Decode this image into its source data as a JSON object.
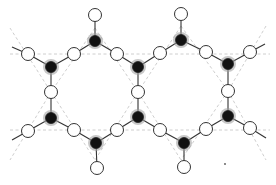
{
  "diagram": {
    "colors": {
      "bond": "#333333",
      "guide": "#c8c8c8",
      "white_node_fill": "#ffffff",
      "black_node_fill": "#111111",
      "halo": "#9a9a9a"
    },
    "node_radius": {
      "white": 6.5,
      "black": 5.5,
      "halo": 8
    },
    "black_nodes": [
      [
        95,
        41
      ],
      [
        181,
        40
      ],
      [
        51,
        67
      ],
      [
        138,
        67
      ],
      [
        228,
        64
      ],
      [
        51,
        118
      ],
      [
        138,
        117
      ],
      [
        228,
        116
      ],
      [
        96,
        143
      ],
      [
        184,
        143
      ]
    ],
    "white_nodes": [
      [
        95,
        15
      ],
      [
        181,
        14
      ],
      [
        28,
        54
      ],
      [
        74,
        54
      ],
      [
        117,
        54
      ],
      [
        160,
        53
      ],
      [
        206,
        52
      ],
      [
        250,
        52
      ],
      [
        51,
        92
      ],
      [
        138,
        92
      ],
      [
        228,
        91
      ],
      [
        28,
        131
      ],
      [
        74,
        130
      ],
      [
        117,
        130
      ],
      [
        160,
        130
      ],
      [
        206,
        129
      ],
      [
        250,
        128
      ],
      [
        97,
        168
      ],
      [
        184,
        167
      ]
    ],
    "bonds": [
      [
        [
          95,
          15
        ],
        [
          95,
          41
        ]
      ],
      [
        [
          181,
          14
        ],
        [
          181,
          40
        ]
      ],
      [
        [
          95,
          41
        ],
        [
          74,
          54
        ]
      ],
      [
        [
          95,
          41
        ],
        [
          117,
          54
        ]
      ],
      [
        [
          181,
          40
        ],
        [
          160,
          53
        ]
      ],
      [
        [
          181,
          40
        ],
        [
          206,
          52
        ]
      ],
      [
        [
          12,
          47
        ],
        [
          28,
          54
        ]
      ],
      [
        [
          28,
          54
        ],
        [
          51,
          67
        ]
      ],
      [
        [
          74,
          54
        ],
        [
          51,
          67
        ]
      ],
      [
        [
          117,
          54
        ],
        [
          138,
          67
        ]
      ],
      [
        [
          160,
          53
        ],
        [
          138,
          67
        ]
      ],
      [
        [
          206,
          52
        ],
        [
          228,
          64
        ]
      ],
      [
        [
          250,
          52
        ],
        [
          228,
          64
        ]
      ],
      [
        [
          250,
          52
        ],
        [
          265,
          44
        ]
      ],
      [
        [
          51,
          67
        ],
        [
          51,
          92
        ]
      ],
      [
        [
          51,
          92
        ],
        [
          51,
          118
        ]
      ],
      [
        [
          138,
          67
        ],
        [
          138,
          92
        ]
      ],
      [
        [
          138,
          92
        ],
        [
          138,
          117
        ]
      ],
      [
        [
          228,
          64
        ],
        [
          228,
          91
        ]
      ],
      [
        [
          228,
          91
        ],
        [
          228,
          116
        ]
      ],
      [
        [
          12,
          140
        ],
        [
          28,
          131
        ]
      ],
      [
        [
          28,
          131
        ],
        [
          51,
          118
        ]
      ],
      [
        [
          74,
          130
        ],
        [
          51,
          118
        ]
      ],
      [
        [
          74,
          130
        ],
        [
          96,
          143
        ]
      ],
      [
        [
          117,
          130
        ],
        [
          96,
          143
        ]
      ],
      [
        [
          117,
          130
        ],
        [
          138,
          117
        ]
      ],
      [
        [
          160,
          130
        ],
        [
          138,
          117
        ]
      ],
      [
        [
          160,
          130
        ],
        [
          184,
          143
        ]
      ],
      [
        [
          206,
          129
        ],
        [
          184,
          143
        ]
      ],
      [
        [
          206,
          129
        ],
        [
          228,
          116
        ]
      ],
      [
        [
          250,
          128
        ],
        [
          228,
          116
        ]
      ],
      [
        [
          250,
          128
        ],
        [
          266,
          138
        ]
      ],
      [
        [
          96,
          143
        ],
        [
          97,
          168
        ]
      ],
      [
        [
          184,
          143
        ],
        [
          184,
          167
        ]
      ]
    ],
    "guides": [
      [
        [
          10,
          54
        ],
        [
          270,
          54
        ]
      ],
      [
        [
          10,
          130
        ],
        [
          270,
          130
        ]
      ],
      [
        [
          10,
          28
        ],
        [
          51,
          92
        ]
      ],
      [
        [
          51,
          92
        ],
        [
          10,
          160
        ]
      ],
      [
        [
          95,
          28
        ],
        [
          138,
          92
        ]
      ],
      [
        [
          138,
          92
        ],
        [
          95,
          160
        ]
      ],
      [
        [
          95,
          28
        ],
        [
          51,
          92
        ]
      ],
      [
        [
          51,
          92
        ],
        [
          95,
          160
        ]
      ],
      [
        [
          181,
          26
        ],
        [
          138,
          92
        ]
      ],
      [
        [
          138,
          92
        ],
        [
          181,
          160
        ]
      ],
      [
        [
          181,
          26
        ],
        [
          228,
          91
        ]
      ],
      [
        [
          228,
          91
        ],
        [
          181,
          160
        ]
      ],
      [
        [
          266,
          26
        ],
        [
          228,
          91
        ]
      ],
      [
        [
          228,
          91
        ],
        [
          266,
          160
        ]
      ]
    ],
    "specks": [
      [
        225,
        164
      ]
    ]
  }
}
